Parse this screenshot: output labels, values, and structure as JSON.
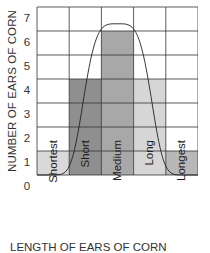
{
  "chart_data": {
    "type": "bar",
    "title": "",
    "xlabel": "LENGTH OF EARS OF CORN",
    "ylabel": "NUMBER OF EARS OF CORN",
    "categories": [
      "Shortest",
      "Short",
      "Medium",
      "Long",
      "Longest"
    ],
    "values": [
      1,
      4,
      6,
      4,
      1
    ],
    "bar_colors": [
      "#d9d9d9",
      "#8f8f8f",
      "#a8a8a8",
      "#d6d6d6",
      "#b8b8b8"
    ],
    "ylim": [
      0,
      7
    ],
    "yticks": [
      0,
      1,
      2,
      3,
      4,
      5,
      6,
      7
    ],
    "grid": true,
    "overlay": {
      "type": "curve",
      "shape": "bell",
      "peak_value": 6.3,
      "peak_category": "Medium"
    }
  },
  "axis": {
    "ylabel": "NUMBER OF EARS OF CORN",
    "xlabel": "LENGTH OF EARS OF CORN",
    "yticks": [
      "0",
      "1",
      "2",
      "3",
      "4",
      "5",
      "6",
      "7"
    ],
    "xticks": [
      "Shortest",
      "Short",
      "Medium",
      "Long",
      "Longest"
    ]
  }
}
